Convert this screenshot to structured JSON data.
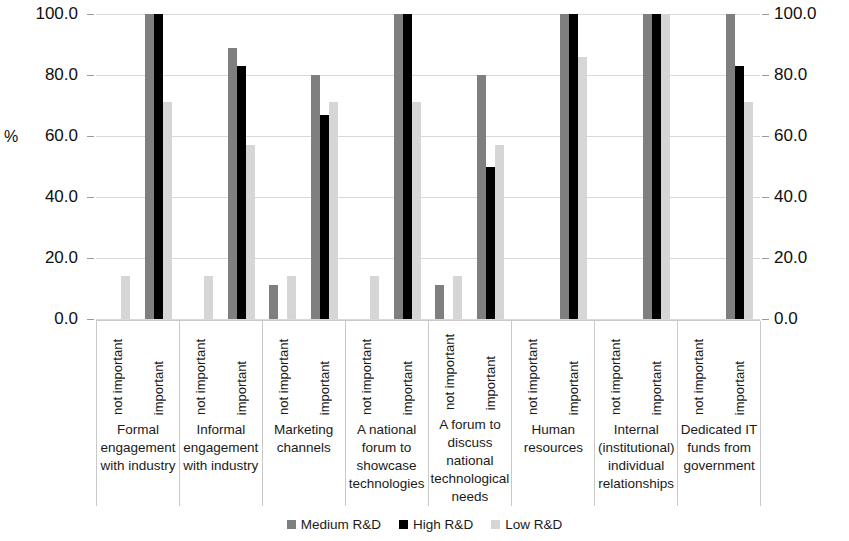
{
  "chart_data": {
    "type": "bar",
    "title": "",
    "xlabel": "",
    "ylabel": "%",
    "ylim": [
      0,
      100
    ],
    "grid": true,
    "legend_position": "bottom",
    "dual_axis": true,
    "y_ticks": [
      "0.0",
      "20.0",
      "40.0",
      "60.0",
      "80.0",
      "100.0"
    ],
    "y_tick_values": [
      0,
      20,
      40,
      60,
      80,
      100
    ],
    "subcategories": [
      "not important",
      "important"
    ],
    "categories": [
      "Formal engagement with industry",
      "Informal engagement with industry",
      "Marketing channels",
      "A national forum to showcase technologies",
      "A forum to discuss national technological needs",
      "Human resources",
      "Internal (institutional) individual relationships",
      "Dedicated IT funds from government"
    ],
    "series": [
      {
        "name": "Medium R&D",
        "color": "#7f7f7f",
        "values_not_important": [
          0,
          0,
          11,
          0,
          11,
          0,
          0,
          0
        ],
        "values_important": [
          100,
          89,
          80,
          100,
          80,
          100,
          100,
          100
        ]
      },
      {
        "name": "High R&D",
        "color": "#000000",
        "values_not_important": [
          0,
          0,
          0,
          0,
          0,
          0,
          0,
          0
        ],
        "values_important": [
          100,
          83,
          67,
          100,
          50,
          100,
          100,
          83
        ]
      },
      {
        "name": "Low R&D",
        "color": "#d6d6d6",
        "values_not_important": [
          14,
          14,
          14,
          14,
          14,
          0,
          0,
          0
        ],
        "values_important": [
          71,
          57,
          71,
          71,
          57,
          86,
          100,
          71
        ]
      }
    ]
  },
  "axis": {
    "left_title": "%",
    "left_ticks": [
      "100.0",
      "80.0",
      "60.0",
      "40.0",
      "20.0",
      "0.0"
    ],
    "right_ticks": [
      "100.0",
      "80.0",
      "60.0",
      "40.0",
      "20.0",
      "0.0"
    ]
  },
  "legend": {
    "items": [
      {
        "label": "Medium R&D",
        "color": "#7f7f7f"
      },
      {
        "label": "High R&D",
        "color": "#000000"
      },
      {
        "label": "Low R&D",
        "color": "#d6d6d6"
      }
    ]
  }
}
